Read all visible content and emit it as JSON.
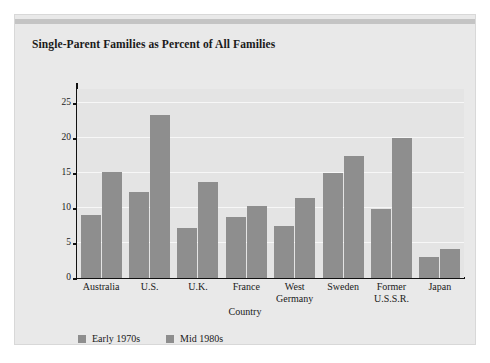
{
  "chart_data": {
    "type": "bar",
    "title": "Single-Parent Families as Percent of All Families",
    "xlabel": "Country",
    "ylabel": "Percent of all families",
    "categories": [
      "Australia",
      "U.S.",
      "U.K.",
      "France",
      "West\nGermany",
      "Sweden",
      "Former\nU.S.S.R.",
      "Japan"
    ],
    "series": [
      {
        "name": "Early 1970s",
        "color": "#8e8e8e",
        "values": [
          9.0,
          12.3,
          7.1,
          8.7,
          7.5,
          15.0,
          9.9,
          3.0
        ]
      },
      {
        "name": "Mid 1980s",
        "color": "#8e8e8e",
        "values": [
          15.2,
          23.3,
          13.7,
          10.3,
          11.4,
          17.4,
          20.0,
          4.1
        ]
      }
    ],
    "ylim": [
      0,
      27
    ],
    "yticks": [
      0,
      5,
      10,
      15,
      20,
      25
    ],
    "ytick_labels": [
      "0",
      "5",
      "10",
      "15",
      "20",
      "25"
    ],
    "grid": true,
    "grid_color": "#f7f7f7",
    "legend_position": "bottom-left",
    "plot_background": "#e4e4e4",
    "panel_background": "#e9e9e9",
    "axis_color": "#111111"
  }
}
